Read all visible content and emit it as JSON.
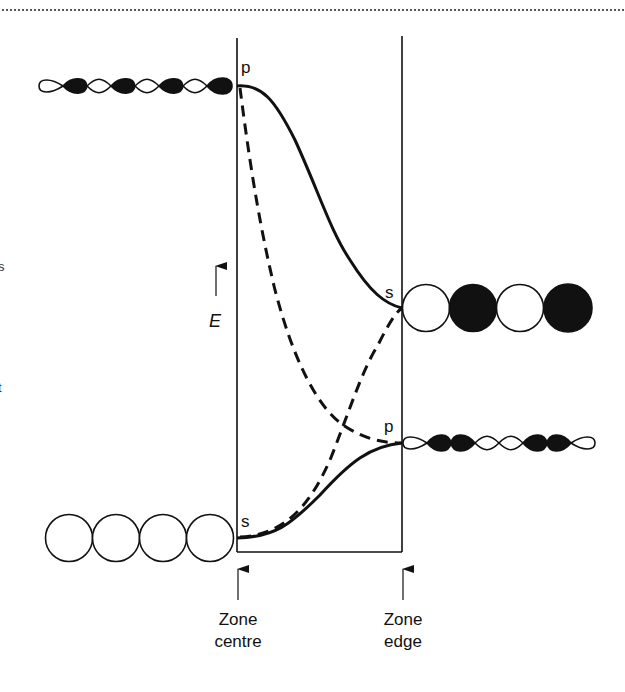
{
  "figure": {
    "type": "band-structure-diagram",
    "axis": {
      "energy_label": "E",
      "zone_centre_label_line1": "Zone",
      "zone_centre_label_line2": "centre",
      "zone_edge_label_line1": "Zone",
      "zone_edge_label_line2": "edge"
    },
    "level_labels": {
      "centre_top": "p",
      "centre_bottom": "s",
      "edge_upper": "s",
      "edge_lower": "p"
    },
    "orbital_chains": {
      "centre_p": {
        "kind": "p-orbital-lobes",
        "lobe_pattern": [
          "white",
          "black",
          "white",
          "black",
          "white",
          "black",
          "white",
          "black"
        ]
      },
      "centre_s": {
        "kind": "s-orbital-circles",
        "circle_pattern": [
          "white",
          "white",
          "white",
          "white"
        ]
      },
      "edge_s": {
        "kind": "s-orbital-circles",
        "circle_pattern": [
          "white",
          "black",
          "white",
          "black"
        ]
      },
      "edge_p": {
        "kind": "p-orbital-lobes",
        "lobe_pattern": [
          "white",
          "black",
          "black",
          "white",
          "white",
          "black",
          "black",
          "white"
        ]
      }
    },
    "curves": [
      {
        "name": "p-band",
        "style": "solid",
        "from": "centre_top (p)",
        "to": "edge_upper (s)"
      },
      {
        "name": "s-band",
        "style": "solid",
        "from": "centre_bottom (s)",
        "to": "edge_lower (p)"
      },
      {
        "name": "p-band-unmixed",
        "style": "dashed",
        "from": "centre_top (p)",
        "to": "edge_lower (p)"
      },
      {
        "name": "s-band-unmixed",
        "style": "dashed",
        "from": "centre_bottom (s)",
        "to": "edge_upper (s)"
      }
    ],
    "margin_fragments": [
      "s",
      "t"
    ],
    "colors": {
      "ink": "#111111",
      "rule": "#555555",
      "background": "#ffffff"
    }
  }
}
